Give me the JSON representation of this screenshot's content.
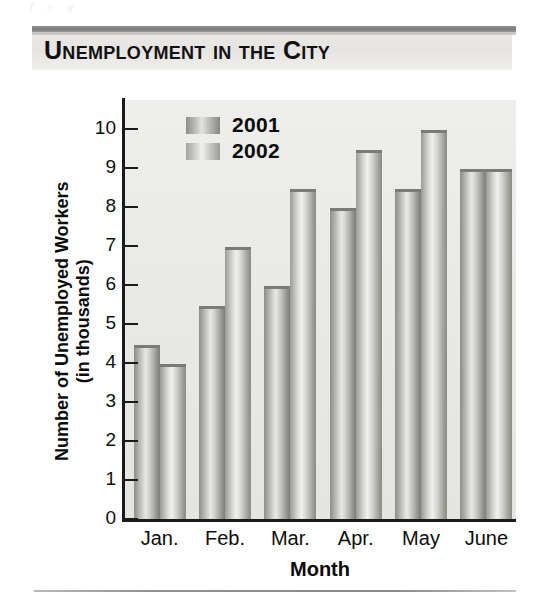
{
  "title": "Unemployment in the City",
  "bleed_text": "f        y             g",
  "axis": {
    "ylabel_line1": "Number of Unemployed Workers",
    "ylabel_line2": "(in thousands)",
    "xlabel": "Month"
  },
  "legend": {
    "items": [
      {
        "label": "2001",
        "key": "y2001"
      },
      {
        "label": "2002",
        "key": "y2002"
      }
    ]
  },
  "chart_data": {
    "type": "bar",
    "title": "Unemployment in the City",
    "xlabel": "Month",
    "ylabel": "Number of Unemployed Workers (in thousands)",
    "categories": [
      "Jan.",
      "Feb.",
      "Mar.",
      "Apr.",
      "May",
      "June"
    ],
    "series": [
      {
        "name": "2001",
        "values": [
          4.5,
          5.5,
          6.0,
          8.0,
          8.5,
          9.0
        ]
      },
      {
        "name": "2002",
        "values": [
          4.0,
          7.0,
          8.5,
          9.5,
          10.0,
          9.0
        ]
      }
    ],
    "ylim": [
      0,
      10
    ],
    "yticks": [
      0,
      1,
      2,
      3,
      4,
      5,
      6,
      7,
      8,
      9,
      10
    ],
    "ytick_labels": [
      "0",
      "1",
      "2",
      "3",
      "4",
      "5",
      "6",
      "7",
      "8",
      "9",
      "10"
    ],
    "grid": false,
    "legend_position": "top-left-inside",
    "units": "thousands of workers"
  },
  "colors": {
    "plot_background": "#e9e9e6",
    "axis": "#1a1a1a",
    "bar_2001": "#8d8d8a",
    "bar_2002": "#b5b5b2",
    "title_band": "#e9e7e4",
    "title_rule": "#8e8e8e",
    "text": "#0b0b0b"
  }
}
